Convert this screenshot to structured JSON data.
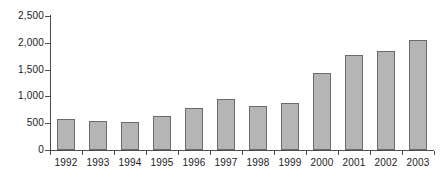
{
  "chart_data": {
    "type": "bar",
    "title": "",
    "subtitle": "",
    "xlabel": "",
    "ylabel": "",
    "categories": [
      "1992",
      "1993",
      "1994",
      "1995",
      "1996",
      "1997",
      "1998",
      "1999",
      "2000",
      "2001",
      "2002",
      "2003"
    ],
    "values": [
      580,
      550,
      520,
      630,
      780,
      950,
      820,
      880,
      1430,
      1770,
      1840,
      2050
    ],
    "series": [
      {
        "name": "",
        "values": [
          580,
          550,
          520,
          630,
          780,
          950,
          820,
          880,
          1430,
          1770,
          1840,
          2050
        ]
      }
    ],
    "ylim": [
      0,
      2500
    ],
    "ytick_values": [
      0,
      500,
      1000,
      1500,
      2000,
      2500
    ],
    "ytick_labels": [
      "0",
      "500",
      "1,000",
      "1,500",
      "2,000",
      "2,500"
    ],
    "grid": false,
    "legend": "none",
    "bar_color": "#b5b5b5",
    "bar_border_color": "#6b6b6b",
    "axis_color": "#4d4d4d",
    "background_color": "#ffffff"
  }
}
